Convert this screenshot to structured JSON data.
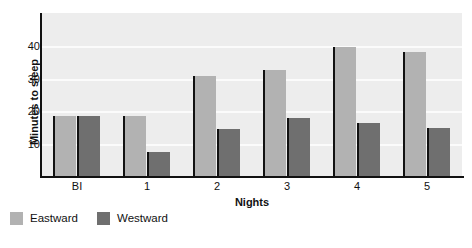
{
  "chart_data": {
    "type": "bar",
    "title": "",
    "xlabel": "Nights",
    "ylabel": "Minutes to sleep",
    "categories": [
      "BI",
      "1",
      "2",
      "3",
      "4",
      "5"
    ],
    "series": [
      {
        "name": "Eastward",
        "color": "#b2b2b2",
        "values": [
          18.5,
          18.5,
          30.7,
          32.5,
          39.5,
          38.0
        ]
      },
      {
        "name": "Westward",
        "color": "#6f6f6f",
        "values": [
          18.5,
          7.5,
          14.5,
          18.0,
          16.5,
          15.0
        ]
      }
    ],
    "ylim": [
      0,
      50
    ],
    "yticks": [
      10,
      20,
      30,
      40
    ],
    "ytick_labels": [
      "10",
      "20",
      "30",
      "40"
    ],
    "grid": true,
    "legend_position": "bottom-left",
    "plot_background": "#ededed",
    "gridline_color": "#fbfbfb",
    "axis_color": "#111111"
  }
}
